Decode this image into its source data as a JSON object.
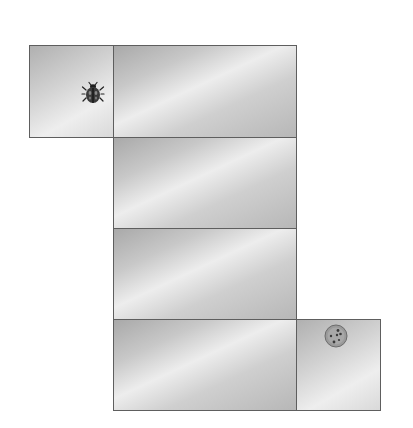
{
  "game": {
    "type": "maze-path",
    "tiles": [
      {
        "id": "start",
        "x": 29,
        "y": 45,
        "w": 85,
        "h": 93,
        "kind": "small"
      },
      {
        "id": "row1",
        "x": 113,
        "y": 45,
        "w": 184,
        "h": 93,
        "kind": "large"
      },
      {
        "id": "row2",
        "x": 113,
        "y": 137,
        "w": 184,
        "h": 92,
        "kind": "large"
      },
      {
        "id": "row3",
        "x": 113,
        "y": 228,
        "w": 184,
        "h": 92,
        "kind": "large"
      },
      {
        "id": "row4",
        "x": 113,
        "y": 319,
        "w": 184,
        "h": 92,
        "kind": "large"
      },
      {
        "id": "goal",
        "x": 296,
        "y": 319,
        "w": 85,
        "h": 92,
        "kind": "small"
      }
    ],
    "player": {
      "icon": "ladybug-icon",
      "x": 82,
      "y": 81
    },
    "goal": {
      "icon": "cookie-icon",
      "x": 323,
      "y": 323
    }
  },
  "colors": {
    "tile_border": "#5e5e5e",
    "background": "#ffffff"
  }
}
